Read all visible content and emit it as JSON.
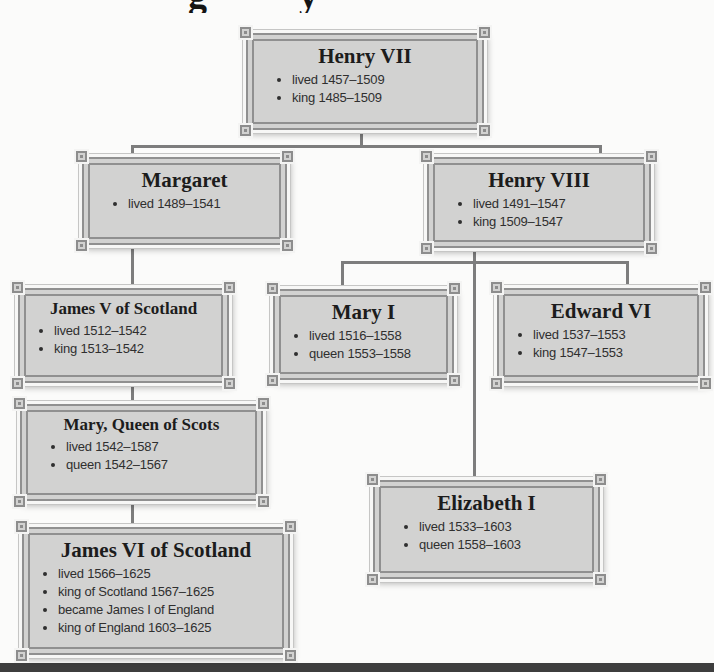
{
  "title_fragment": {
    "left_glyph": "g",
    "right_glyph": "y"
  },
  "colors": {
    "node_fill": "#d2d2d1",
    "node_border": "#909090",
    "connector": "#7d7d7d",
    "background": "#fbfbfa",
    "bottom_bar": "#3e3e3e"
  },
  "people": [
    {
      "name": "Henry VII",
      "bullets": [
        "lived 1457–1509",
        "king 1485–1509"
      ]
    },
    {
      "name": "Margaret",
      "bullets": [
        "lived 1489–1541"
      ]
    },
    {
      "name": "Henry VIII",
      "bullets": [
        "lived 1491–1547",
        "king 1509–1547"
      ]
    },
    {
      "name": "James V of Scotland",
      "bullets": [
        "lived 1512–1542",
        "king 1513–1542"
      ]
    },
    {
      "name": "Mary I",
      "bullets": [
        "lived 1516–1558",
        "queen 1553–1558"
      ]
    },
    {
      "name": "Edward VI",
      "bullets": [
        "lived 1537–1553",
        "king 1547–1553"
      ]
    },
    {
      "name": "Mary, Queen of Scots",
      "bullets": [
        "lived 1542–1587",
        "queen 1542–1567"
      ]
    },
    {
      "name": "James VI of Scotland",
      "bullets": [
        "lived 1566–1625",
        "king of Scotland 1567–1625",
        "became James I of England",
        "king of England 1603–1625"
      ]
    },
    {
      "name": "Elizabeth I",
      "bullets": [
        "lived 1533–1603",
        "queen 1558–1603"
      ]
    }
  ]
}
